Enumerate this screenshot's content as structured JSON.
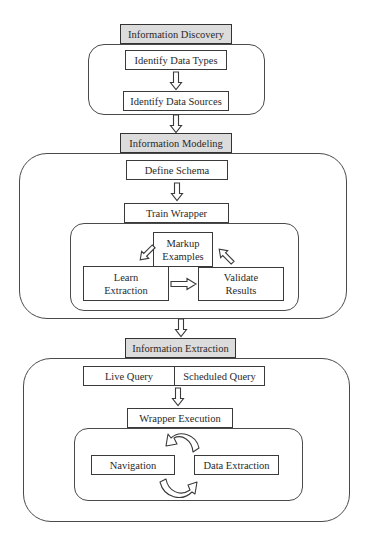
{
  "diagram": {
    "stages": [
      {
        "title": "Information Discovery",
        "steps": [
          "Identify Data Types",
          "Identify Data Sources"
        ]
      },
      {
        "title": "Information Modeling",
        "steps": [
          "Define Schema",
          "Train Wrapper"
        ],
        "training_loop": {
          "markup": "Markup Examples",
          "markup_line1": "Markup",
          "markup_line2": "Examples",
          "learn_line1": "Learn",
          "learn_line2": "Extraction",
          "validate_line1": "Validate",
          "validate_line2": "Results"
        }
      },
      {
        "title": "Information Extraction",
        "query_modes": [
          "Live Query",
          "Scheduled Query"
        ],
        "steps": [
          "Wrapper Execution"
        ],
        "execution_loop": [
          "Navigation",
          "Data Extraction"
        ]
      }
    ],
    "colors": {
      "header_fill": "#dcdcdc",
      "stroke": "#3a3a3a",
      "background": "#ffffff"
    }
  }
}
